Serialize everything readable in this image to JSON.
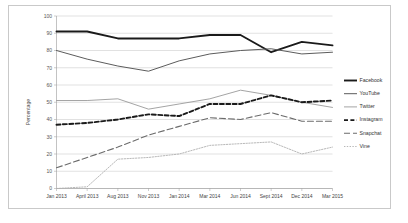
{
  "chart_data": {
    "type": "line",
    "title": "",
    "xlabel": "",
    "ylabel": "Percentage",
    "ylim": [
      0,
      100
    ],
    "ytick_step": 10,
    "grid": true,
    "legend_position": "right",
    "categories": [
      "Jan 2013",
      "April 2013",
      "Aug 2013",
      "Nov 2013",
      "Jan 2014",
      "Mar 2014",
      "Jun 2014",
      "Sept 2014",
      "Dec 2014",
      "Mar 2015"
    ],
    "yticks": [
      "0",
      "10",
      "20",
      "30",
      "40",
      "50",
      "60",
      "70",
      "80",
      "90",
      "100"
    ],
    "series": [
      {
        "name": "Facebook",
        "color": "#1a1a1a",
        "style": "solid-thick",
        "values": [
          91,
          91,
          87,
          87,
          87,
          89,
          89,
          79,
          85,
          83
        ]
      },
      {
        "name": "YouTube",
        "color": "#5c5c5c",
        "style": "solid-medium",
        "values": [
          80,
          75,
          71,
          68,
          74,
          78,
          80,
          81,
          78,
          79
        ]
      },
      {
        "name": "Twitter",
        "color": "#9a9a9a",
        "style": "solid-thin",
        "values": [
          51,
          51,
          52,
          46,
          49,
          52,
          57,
          54,
          50,
          47
        ]
      },
      {
        "name": "Instagram",
        "color": "#1a1a1a",
        "style": "dashed-thick",
        "values": [
          37,
          38,
          40,
          43,
          42,
          49,
          49,
          54,
          50,
          51
        ]
      },
      {
        "name": "Snapchat",
        "color": "#6b6b6b",
        "style": "dashed-long",
        "values": [
          12,
          18,
          24,
          31,
          36,
          41,
          40,
          44,
          39,
          39
        ]
      },
      {
        "name": "Vine",
        "color": "#b0b0b0",
        "style": "dotted",
        "values": [
          0,
          1,
          17,
          18,
          20,
          25,
          26,
          27,
          20,
          24
        ]
      }
    ]
  },
  "legend": {
    "items": [
      {
        "label": "Facebook"
      },
      {
        "label": "YouTube"
      },
      {
        "label": "Twitter"
      },
      {
        "label": "Instagram"
      },
      {
        "label": "Snapchat"
      },
      {
        "label": "Vine"
      }
    ]
  }
}
